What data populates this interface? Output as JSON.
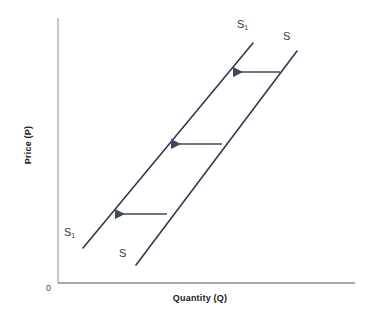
{
  "figure": {
    "title": "",
    "background_color": "#ffffff"
  },
  "axes": {
    "origin_label": "0",
    "x_axis": {
      "label": "Quantity (Q)",
      "color": "#8c8c8c",
      "x_start": 58,
      "x_end": 355,
      "y": 283
    },
    "y_axis": {
      "label": "Price (P)",
      "color": "#b0b0b0",
      "x": 58,
      "y_start": 18,
      "y_end": 283
    }
  },
  "chart_data": {
    "type": "line",
    "title": "",
    "xlabel": "Quantity (Q)",
    "ylabel": "Price (P)",
    "grid": false,
    "legend": "none",
    "annotation": "Leftward shift of the supply curve from S to S1 (decrease in supply)",
    "series": [
      {
        "name": "S",
        "label": "S",
        "color": "#3a3550",
        "line_width": 1.6,
        "label_top": "S",
        "label_bottom": "S",
        "points": [
          {
            "x": 136,
            "y": 265
          },
          {
            "x": 297,
            "y": 51
          }
        ]
      },
      {
        "name": "S1",
        "label": "S1",
        "color": "#3a3550",
        "line_width": 1.6,
        "label_top": "S",
        "label_top_sub": "1",
        "label_bottom": "S",
        "label_bottom_sub": "1",
        "points": [
          {
            "x": 83,
            "y": 248
          },
          {
            "x": 253,
            "y": 43
          }
        ]
      }
    ],
    "shift_arrows": {
      "color": "#3d4a5c",
      "direction": "left",
      "count": 3,
      "items": [
        {
          "name": "arrow-top",
          "x_from": 280,
          "x_to": 231,
          "y": 72
        },
        {
          "name": "arrow-middle",
          "x_from": 222,
          "x_to": 169,
          "y": 144
        },
        {
          "name": "arrow-bottom",
          "x_from": 167,
          "x_to": 113,
          "y": 214
        }
      ]
    }
  }
}
